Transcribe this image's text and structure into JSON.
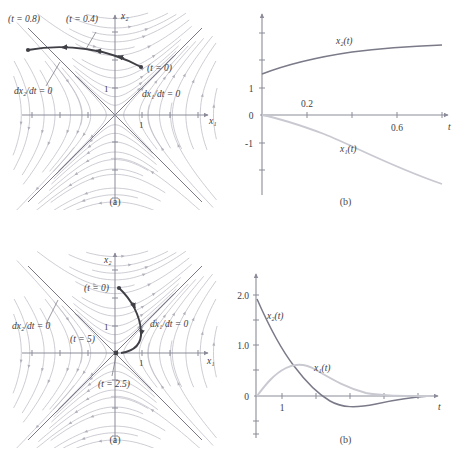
{
  "figure": {
    "colors": {
      "streamline": "#b9b9c4",
      "nullcline": "#7a7a88",
      "trajectory": "#3f3f46",
      "axis": "#8b8b99",
      "curve_dark": "#7a7a88",
      "curve_light": "#c9c9d1",
      "text": "#3c3c44",
      "background": "#ffffff"
    },
    "panels": [
      {
        "id": "top-left",
        "caption": "(a)",
        "type": "phase-portrait",
        "axis_labels": {
          "x": "x₁",
          "y": "x₂"
        },
        "tick_labels": {
          "x": [
            "1"
          ],
          "y": [
            "1"
          ]
        },
        "nullcline_labels": [
          "dx₂/dt = 0",
          "dx₁/dt = 0"
        ],
        "trajectory_markers": [
          "(t = 0.8)",
          "(t = 0.4)",
          "(t = 0)"
        ]
      },
      {
        "id": "top-right",
        "caption": "(b)",
        "type": "time-response",
        "axis_labels": {
          "x": "t",
          "y": ""
        },
        "x_ticks": [
          "0.2",
          "0.6"
        ],
        "y_ticks": [
          "1",
          "0",
          "-1"
        ],
        "curve_labels": [
          "x₂(t)",
          "x₁(t)"
        ]
      },
      {
        "id": "bottom-left",
        "caption": "(a)",
        "type": "phase-portrait",
        "axis_labels": {
          "x": "x₁",
          "y": "x₂"
        },
        "tick_labels": {
          "x": [
            "1"
          ],
          "y": [
            "1"
          ]
        },
        "nullcline_labels": [
          "dx₂/dt = 0",
          "dx₁/dt = 0"
        ],
        "trajectory_markers": [
          "(t = 0)",
          "(t = 5)",
          "(t = 2.5)"
        ]
      },
      {
        "id": "bottom-right",
        "caption": "(b)",
        "type": "time-response",
        "axis_labels": {
          "x": "t",
          "y": ""
        },
        "x_ticks": [
          "1"
        ],
        "y_ticks": [
          "2.0",
          "1.0",
          "0"
        ],
        "curve_labels": [
          "x₂(t)",
          "x₁(t)"
        ]
      }
    ]
  },
  "chart_data": [
    {
      "id": "top-left",
      "type": "scatter",
      "subtype": "phase-portrait-with-trajectory",
      "title": "",
      "xlabel": "x₁",
      "ylabel": "x₂",
      "xlim": [
        -2.6,
        2.6
      ],
      "ylim": [
        -2.6,
        2.6
      ],
      "grid": false,
      "legend": "none",
      "nullclines": [
        {
          "label": "dx₂/dt = 0",
          "line": "x₂ = -x₁",
          "slope": -1,
          "intercept": 0
        },
        {
          "label": "dx₁/dt = 0",
          "line": "x₂ = x₁",
          "slope": 1,
          "intercept": 0
        }
      ],
      "annotations": [
        {
          "text": "(t = 0.8)",
          "x": -1.85,
          "y": 2.15
        },
        {
          "text": "(t = 0.4)",
          "x": -0.6,
          "y": 2.3
        },
        {
          "text": "(t = 0)",
          "x": 0.42,
          "y": 1.42
        },
        {
          "text": "dx₂/dt = 0",
          "x": -1.85,
          "y": 0.95
        },
        {
          "text": "dx₁/dt = 0",
          "x": 1.05,
          "y": 0.78
        }
      ],
      "series": [
        {
          "name": "trajectory",
          "points": [
            [
              0.3,
              1.5
            ],
            [
              0.1,
              1.62
            ],
            [
              -0.12,
              1.72
            ],
            [
              -0.35,
              1.8
            ],
            [
              -0.6,
              1.86
            ],
            [
              -0.85,
              1.9
            ],
            [
              -1.1,
              1.92
            ],
            [
              -1.35,
              1.92
            ],
            [
              -1.6,
              1.9
            ],
            [
              -1.85,
              1.86
            ]
          ],
          "markers_at": [
            [
              0.3,
              1.5
            ],
            [
              -0.6,
              1.86
            ],
            [
              -1.85,
              1.86
            ]
          ]
        }
      ]
    },
    {
      "id": "top-right",
      "type": "line",
      "title": "",
      "xlabel": "t",
      "ylabel": "",
      "xlim": [
        0,
        0.86
      ],
      "ylim": [
        -3.1,
        3.3
      ],
      "x_ticks": [
        0.2,
        0.4,
        0.6,
        0.8
      ],
      "x_tick_labels": [
        "0.2",
        "",
        "0.6",
        ""
      ],
      "y_ticks": [
        -3,
        -2,
        -1,
        0,
        1,
        2,
        3
      ],
      "y_tick_labels": [
        "",
        "",
        "-1",
        "0",
        "1",
        "",
        ""
      ],
      "grid": false,
      "legend": "inline-labels",
      "series": [
        {
          "name": "x₂(t)",
          "color": "#7a7a88",
          "x": [
            0.0,
            0.1,
            0.2,
            0.3,
            0.4,
            0.5,
            0.6,
            0.7,
            0.8,
            0.85
          ],
          "y": [
            1.5,
            1.7,
            1.86,
            1.99,
            2.09,
            2.17,
            2.24,
            2.29,
            2.33,
            2.35
          ]
        },
        {
          "name": "x₁(t)",
          "color": "#c9c9d1",
          "x": [
            0.0,
            0.1,
            0.2,
            0.3,
            0.4,
            0.5,
            0.6,
            0.7,
            0.8,
            0.85
          ],
          "y": [
            0.0,
            -0.13,
            -0.3,
            -0.52,
            -0.78,
            -1.08,
            -1.43,
            -1.83,
            -2.27,
            -2.52
          ]
        }
      ]
    },
    {
      "id": "bottom-left",
      "type": "scatter",
      "subtype": "phase-portrait-with-trajectory",
      "title": "",
      "xlabel": "x₁",
      "ylabel": "x₂",
      "xlim": [
        -2.6,
        2.6
      ],
      "ylim": [
        -2.6,
        2.6
      ],
      "grid": false,
      "legend": "none",
      "nullclines": [
        {
          "label": "dx₂/dt = 0",
          "line": "x₂ = -x₁",
          "slope": -1,
          "intercept": 0
        },
        {
          "label": "dx₁/dt = 0",
          "line": "x₂ = x₁",
          "slope": 1,
          "intercept": 0
        }
      ],
      "annotations": [
        {
          "text": "(t = 0)",
          "x": -0.55,
          "y": 1.85
        },
        {
          "text": "(t = 5)",
          "x": -0.95,
          "y": 0.42
        },
        {
          "text": "(t = 2.5)",
          "x": -0.1,
          "y": -0.88
        },
        {
          "text": "dx₂/dt = 0",
          "x": -2.05,
          "y": 0.95
        },
        {
          "text": "dx₁/dt = 0",
          "x": 1.05,
          "y": 0.95
        }
      ],
      "series": [
        {
          "name": "trajectory",
          "points": [
            [
              0.12,
              1.88
            ],
            [
              0.32,
              1.6
            ],
            [
              0.45,
              1.28
            ],
            [
              0.52,
              0.96
            ],
            [
              0.55,
              0.66
            ],
            [
              0.52,
              0.4
            ],
            [
              0.44,
              0.2
            ],
            [
              0.3,
              0.07
            ],
            [
              0.12,
              0.01
            ],
            [
              0.0,
              0.0
            ]
          ],
          "markers_at": [
            [
              0.12,
              1.88
            ],
            [
              0.0,
              0.0
            ]
          ]
        }
      ]
    },
    {
      "id": "bottom-right",
      "type": "line",
      "title": "",
      "xlabel": "t",
      "ylabel": "",
      "xlim": [
        0,
        7.6
      ],
      "ylim": [
        -1.1,
        2.6
      ],
      "x_ticks": [
        1,
        2,
        3,
        4,
        5,
        6,
        7
      ],
      "x_tick_labels": [
        "1",
        "",
        "",
        "",
        "",
        "",
        ""
      ],
      "y_ticks": [
        -1.0,
        -0.5,
        0,
        0.5,
        1.0,
        1.5,
        2.0
      ],
      "y_tick_labels": [
        "",
        "",
        "0",
        "",
        "1.0",
        "",
        "2.0"
      ],
      "grid": false,
      "legend": "inline-labels",
      "series": [
        {
          "name": "x₂(t)",
          "color": "#7a7a88",
          "x": [
            0.0,
            0.4,
            0.8,
            1.2,
            1.6,
            2.0,
            2.4,
            2.8,
            3.2,
            3.6,
            4.0,
            4.6,
            5.2,
            6.0,
            7.0,
            7.5
          ],
          "y": [
            1.9,
            1.45,
            1.08,
            0.74,
            0.44,
            0.18,
            0.0,
            -0.12,
            -0.18,
            -0.2,
            -0.19,
            -0.14,
            -0.09,
            -0.04,
            -0.01,
            0.0
          ]
        },
        {
          "name": "x₁(t)",
          "color": "#c9c9d1",
          "x": [
            0.0,
            0.3,
            0.6,
            0.9,
            1.2,
            1.5,
            1.8,
            2.2,
            2.6,
            3.0,
            3.5,
            4.0,
            4.6,
            5.2,
            6.0,
            7.0,
            7.5
          ],
          "y": [
            0.0,
            0.28,
            0.48,
            0.58,
            0.62,
            0.61,
            0.57,
            0.48,
            0.38,
            0.29,
            0.19,
            0.12,
            0.06,
            0.03,
            0.01,
            0.0,
            0.0
          ]
        }
      ]
    }
  ]
}
